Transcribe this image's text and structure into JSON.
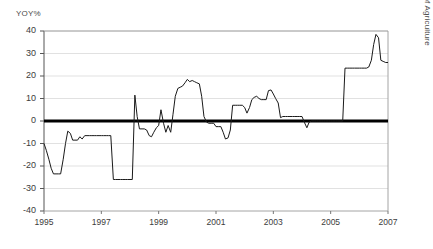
{
  "chart_data": {
    "type": "line",
    "title": "",
    "ylabel": "YOY%",
    "xlabel": "",
    "ylim": [
      -40,
      40
    ],
    "xlim": [
      1995,
      2007
    ],
    "yticks": [
      40,
      30,
      20,
      10,
      0,
      -10,
      -20,
      -30,
      -40
    ],
    "ytick_labels": [
      "40",
      "30",
      "20",
      "10",
      "0",
      "-10",
      "-20",
      "-30",
      "-40"
    ],
    "xticks": [
      1995,
      1997,
      1999,
      2001,
      2003,
      2005,
      2007
    ],
    "xtick_labels": [
      "1995",
      "1997",
      "1999",
      "2001",
      "2003",
      "2005",
      "2007"
    ],
    "grid": "horizontal",
    "grid_color": "#d9d9d9",
    "legend": "none",
    "zero_line": true,
    "zero_line_color": "#000000",
    "series_color": "#1a1a1a",
    "source_note": "Source: U.S. Department of Agriculture",
    "series": [
      {
        "name": "YOY%",
        "x": [
          1995.0,
          1995.08,
          1995.17,
          1995.25,
          1995.33,
          1995.42,
          1995.5,
          1995.58,
          1995.67,
          1995.75,
          1995.83,
          1995.92,
          1996.0,
          1996.08,
          1996.17,
          1996.25,
          1996.33,
          1996.42,
          1996.5,
          1996.58,
          1996.67,
          1996.75,
          1996.83,
          1996.92,
          1997.0,
          1997.08,
          1997.17,
          1997.25,
          1997.33,
          1997.42,
          1997.5,
          1997.58,
          1997.67,
          1997.75,
          1997.83,
          1997.92,
          1998.0,
          1998.08,
          1998.17,
          1998.25,
          1998.33,
          1998.42,
          1998.5,
          1998.58,
          1998.67,
          1998.75,
          1998.83,
          1998.92,
          1999.0,
          1999.08,
          1999.17,
          1999.25,
          1999.33,
          1999.42,
          1999.5,
          1999.58,
          1999.67,
          1999.75,
          1999.83,
          1999.92,
          2000.0,
          2000.08,
          2000.17,
          2000.25,
          2000.33,
          2000.42,
          2000.5,
          2000.58,
          2000.67,
          2000.75,
          2000.83,
          2000.92,
          2001.0,
          2001.08,
          2001.17,
          2001.25,
          2001.33,
          2001.42,
          2001.5,
          2001.58,
          2001.67,
          2001.75,
          2001.83,
          2001.92,
          2002.0,
          2002.08,
          2002.17,
          2002.25,
          2002.33,
          2002.42,
          2002.5,
          2002.58,
          2002.67,
          2002.75,
          2002.83,
          2002.92,
          2003.0,
          2003.08,
          2003.17,
          2003.25,
          2003.33,
          2003.42,
          2003.5,
          2003.58,
          2003.67,
          2003.75,
          2003.83,
          2003.92,
          2004.0,
          2004.08,
          2004.17,
          2004.25,
          2004.33,
          2004.42,
          2004.5,
          2004.58,
          2004.67,
          2004.75,
          2004.83,
          2004.92,
          2005.0,
          2005.08,
          2005.17,
          2005.25,
          2005.33,
          2005.42,
          2005.5,
          2005.58,
          2005.67,
          2005.75,
          2005.83,
          2005.92,
          2006.0,
          2006.08,
          2006.17,
          2006.25,
          2006.33,
          2006.42,
          2006.5,
          2006.58,
          2006.67,
          2006.75,
          2006.83,
          2006.92,
          2007.0
        ],
        "values": [
          -10.0,
          -13.0,
          -17.0,
          -21.0,
          -23.5,
          -23.5,
          -23.5,
          -23.5,
          -17.0,
          -10.0,
          -4.5,
          -5.5,
          -8.5,
          -8.5,
          -8.5,
          -7.0,
          -8.0,
          -6.5,
          -6.5,
          -6.5,
          -6.5,
          -6.5,
          -6.5,
          -6.5,
          -6.5,
          -6.5,
          -6.5,
          -6.5,
          -6.5,
          -26.0,
          -26.0,
          -26.0,
          -26.0,
          -26.0,
          -26.0,
          -26.0,
          -26.0,
          -26.0,
          11.5,
          2.0,
          -3.5,
          -3.5,
          -3.5,
          -4.0,
          -6.5,
          -7.0,
          -5.0,
          -3.0,
          -2.0,
          5.0,
          -1.0,
          -5.0,
          -2.0,
          -5.0,
          3.0,
          11.0,
          14.5,
          15.0,
          15.5,
          17.0,
          18.5,
          17.5,
          18.0,
          17.5,
          17.0,
          16.5,
          11.0,
          2.0,
          -0.5,
          -1.0,
          -1.0,
          -1.0,
          -2.5,
          -2.5,
          -2.5,
          -5.0,
          -8.0,
          -7.5,
          -4.0,
          7.0,
          7.0,
          7.0,
          7.0,
          7.0,
          6.0,
          3.5,
          6.0,
          9.5,
          10.5,
          11.0,
          10.0,
          9.5,
          9.5,
          9.5,
          13.5,
          13.8,
          12.0,
          10.0,
          8.0,
          1.5,
          2.0,
          2.0,
          2.0,
          2.0,
          2.0,
          2.0,
          2.0,
          2.0,
          2.0,
          -0.5,
          -3.0,
          -0.5,
          0.0,
          0.0,
          0.0,
          0.0,
          0.0,
          0.0,
          0.0,
          0.0,
          0.0,
          0.0,
          0.0,
          0.0,
          0.0,
          0.0,
          23.5,
          23.5,
          23.5,
          23.5,
          23.5,
          23.5,
          23.5,
          23.5,
          23.5,
          23.5,
          24.0,
          27.0,
          34.0,
          38.5,
          37.0,
          27.0,
          26.5,
          26.0,
          26.0
        ]
      }
    ]
  },
  "axis": {
    "y_axis_title": "YOY%"
  },
  "footer": {
    "source": "Source: U.S. Department of Agriculture"
  }
}
